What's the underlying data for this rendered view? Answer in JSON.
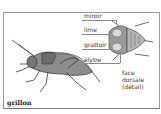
{
  "diagram": {
    "title": "grillon",
    "detail_caption": [
      "face",
      "dorsale",
      "(détail)"
    ],
    "labels": [
      {
        "id": "miroir",
        "text": "miroir"
      },
      {
        "id": "lime",
        "text": "lime"
      },
      {
        "id": "grattoir",
        "text": "grattoir"
      },
      {
        "id": "elytre",
        "text": "élytre"
      }
    ],
    "colors": {
      "frame": "#9a9a9a",
      "ink": "#333333",
      "illustration": "#555555"
    }
  }
}
